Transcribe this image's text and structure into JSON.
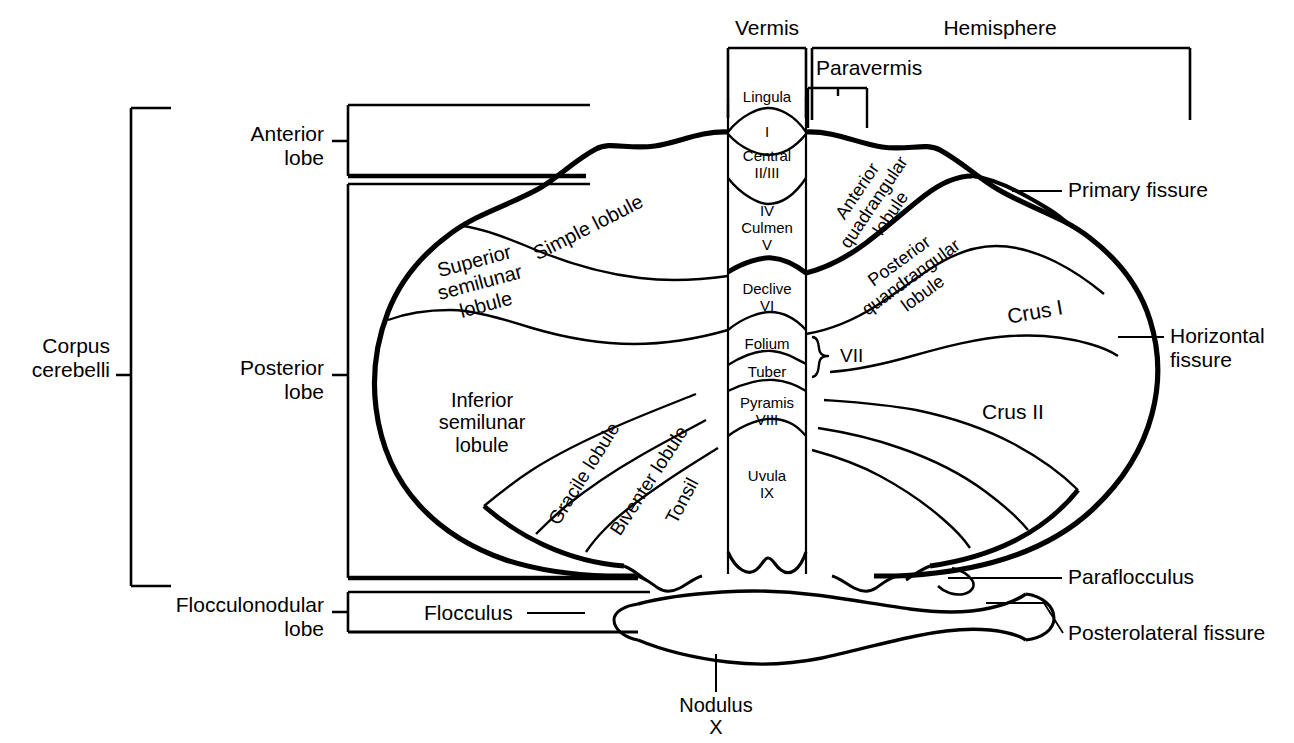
{
  "figure": {
    "linecolor": "#000000",
    "background": "#ffffff"
  },
  "top_brackets": {
    "vermis_label": "Vermis",
    "hemisphere_label": "Hemisphere",
    "paravermis_label": "Paravermis"
  },
  "left_brackets": {
    "corpus_cerebelli": "Corpus\ncerebelli",
    "anterior_lobe": "Anterior\nlobe",
    "posterior_lobe": "Posterior\nlobe",
    "flocculonodular_lobe": "Flocculonodular\nlobe"
  },
  "vermis_segments": [
    {
      "name": "Lingula",
      "label": "Lingula"
    },
    {
      "name": "lobule-I",
      "label": "I"
    },
    {
      "name": "Central",
      "label": "Central\nII/III"
    },
    {
      "name": "Culmen",
      "label": "IV\nCulmen\nV"
    },
    {
      "name": "Declive",
      "label": "Declive\nVI"
    },
    {
      "name": "Folium",
      "label": "Folium"
    },
    {
      "name": "Tuber",
      "label": "Tuber"
    },
    {
      "name": "Pyramis",
      "label": "Pyramis\nVIII"
    },
    {
      "name": "Uvula",
      "label": "Uvula\nIX"
    },
    {
      "name": "Nodulus",
      "label": "Nodulus\nX"
    }
  ],
  "vermis_bracket": {
    "label": "VII"
  },
  "hemisphere_labels": {
    "simple_lobule": "Simple lobule",
    "superior_semilunar_lobule": "Superior\nsemilunar\nlobule",
    "inferior_semilunar_lobule": "Inferior\nsemilunar\nlobule",
    "gracile_lobule": "Gracile lobule",
    "biventer_lobule": "Biventer lobule",
    "tonsil": "Tonsil",
    "anterior_quadrangular_lobule": "Anterior\nquadrangular\nlobule",
    "posterior_quadrangular_lobule": "Posterior\nquandrangular\nlobule",
    "crus_i": "Crus I",
    "crus_ii": "Crus II",
    "flocculus": "Flocculus"
  },
  "right_callouts": [
    {
      "name": "primary-fissure",
      "label": "Primary fissure"
    },
    {
      "name": "horizontal-fissure",
      "label": "Horizontal\nfissure"
    },
    {
      "name": "paraflocculus",
      "label": "Paraflocculus"
    },
    {
      "name": "posterolateral-fissure",
      "label": "Posterolateral fissure"
    }
  ]
}
